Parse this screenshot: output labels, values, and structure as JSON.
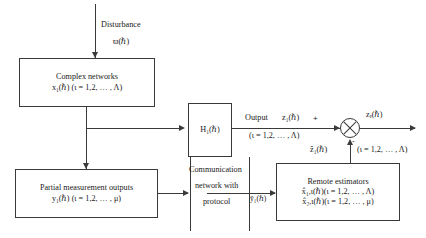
{
  "diagram": {
    "disturbance": {
      "label": "Disturbance",
      "signal": "ϖ(ℏ)"
    },
    "blocks": {
      "complex_networks": {
        "line1": "Complex networks",
        "line2": "x₁(ℏ)  (ι = 1,2, … , Λ)"
      },
      "partial_measurement": {
        "line1": "Partial measurement outputs",
        "line2": "y₁(ℏ)  (ι = 1,2, … , μ)"
      },
      "h_block": {
        "label": "H₁(ℏ)"
      },
      "communication": {
        "line1": "Communication",
        "line2": "network with",
        "line3": "protocol"
      },
      "remote_estimators": {
        "line1": "Remote estimators",
        "line2": "x̂₁,ι(ℏ)(ι = 1,2, … , Λ)",
        "line3": "x̂₂,ι(ℏ)(ι = 1,2, … , μ)"
      }
    },
    "signals": {
      "output_label": "Output",
      "output_z": "z₁(ℏ)",
      "output_range": "(ι = 1,2, … , Λ)",
      "z_hat": "ẑ₁(ℏ)",
      "z_hat_range": "(ι = 1,2, … , Λ)",
      "y_bar": "ȳ₁(ℏ)",
      "z_error": "zₑ(ℏ)",
      "plus_sign": "+",
      "minus_sign": "-"
    },
    "colors": {
      "stroke": "#3a3a3a",
      "text": "#1a1a1a",
      "background": "#ffffff"
    }
  }
}
